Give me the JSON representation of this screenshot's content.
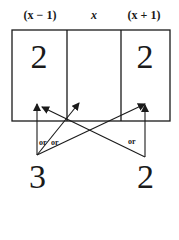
{
  "headers": [
    "(x − 1)",
    "x",
    "(x + 1)"
  ],
  "cells": [
    "2",
    "",
    "2"
  ],
  "bottom_values": {
    "left": "3",
    "right": "2"
  },
  "arrow_labels": [
    "or",
    "or",
    "or"
  ],
  "colors": {
    "line": "#1a1a1a",
    "background": "#ffffff"
  }
}
